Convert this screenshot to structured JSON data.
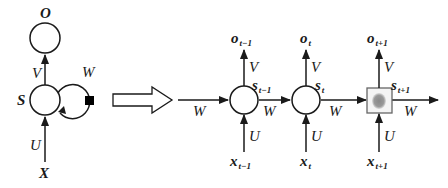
{
  "diagram": {
    "type": "rnn-unfolding",
    "folded": {
      "output_label": "O",
      "state_label": "S",
      "input_label": "X",
      "weights": {
        "input_to_state": "U",
        "state_to_output": "V",
        "recurrent": "W"
      }
    },
    "unfold_arrow": "hollow-right-arrow",
    "unfolded": {
      "steps": [
        {
          "output": "o",
          "output_sub": "t−1",
          "state": "s",
          "state_sub": "t−1",
          "input": "x",
          "input_sub": "t−1",
          "V": "V",
          "U": "U",
          "W_in": "W",
          "W_out": "W"
        },
        {
          "output": "o",
          "output_sub": "t",
          "state": "s",
          "state_sub": "t",
          "input": "x",
          "input_sub": "t",
          "V": "V",
          "U": "U",
          "W_out": "W"
        },
        {
          "output": "o",
          "output_sub": "t+1",
          "state": "s",
          "state_sub": "t+1",
          "input": "x",
          "input_sub": "t+1",
          "V": "V",
          "U": "U",
          "W_out": "W"
        }
      ]
    }
  },
  "colors": {
    "stroke": "#1a1a1a",
    "background": "#ffffff",
    "blob": "#777777"
  }
}
